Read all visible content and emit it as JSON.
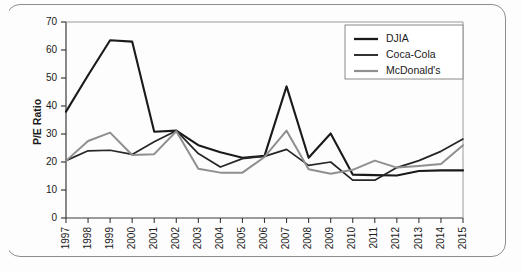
{
  "figure": {
    "frame_style": "rounded-rectangle-scan-border",
    "background_color": "#fdfdfd"
  },
  "chart_data": {
    "type": "line",
    "title": "",
    "subtitle": "",
    "xlabel": "",
    "ylabel": "P/E Ratio",
    "x": [
      1997,
      1998,
      1999,
      2000,
      2001,
      2002,
      2003,
      2004,
      2005,
      2006,
      2007,
      2008,
      2009,
      2010,
      2011,
      2012,
      2013,
      2014,
      2015
    ],
    "categories": [
      "1997",
      "1998",
      "1999",
      "2000",
      "2001",
      "2002",
      "2003",
      "2004",
      "2005",
      "2006",
      "2007",
      "2008",
      "2009",
      "2010",
      "2011",
      "2012",
      "2013",
      "2014",
      "2015"
    ],
    "xlim": [
      1997,
      2015
    ],
    "ylim": [
      0,
      70
    ],
    "yticks": [
      0,
      10,
      20,
      30,
      40,
      50,
      60,
      70
    ],
    "ytick_labels": [
      "0",
      "10",
      "20",
      "30",
      "40",
      "50",
      "60",
      "70"
    ],
    "grid": false,
    "legend_position": "top-right",
    "series": [
      {
        "name": "DJIA",
        "color": "#1a1a1a",
        "width": 2.1,
        "values": [
          38.0,
          51.0,
          63.5,
          63.0,
          30.8,
          31.2,
          26.0,
          23.5,
          21.5,
          22.2,
          47.0,
          21.5,
          30.2,
          15.5,
          15.3,
          15.2,
          16.8,
          17.0,
          17.0
        ]
      },
      {
        "name": "Coca-Cola",
        "color": "#262626",
        "width": 1.7,
        "values": [
          20.5,
          24.0,
          24.2,
          22.7,
          27.2,
          31.2,
          23.0,
          18.2,
          21.2,
          22.0,
          24.5,
          18.8,
          20.0,
          13.5,
          13.5,
          18.0,
          20.5,
          23.8,
          28.2
        ]
      },
      {
        "name": "McDonald's",
        "color": "#8f8f8f",
        "width": 2.0,
        "values": [
          20.4,
          27.5,
          30.5,
          22.5,
          22.8,
          31.0,
          17.6,
          16.2,
          16.2,
          21.8,
          31.2,
          17.4,
          15.8,
          17.2,
          20.5,
          18.0,
          18.6,
          19.3,
          26.0
        ]
      }
    ]
  },
  "legend": {
    "entries": [
      {
        "label": "DJIA"
      },
      {
        "label": "Coca-Cola"
      },
      {
        "label": "McDonald's"
      }
    ]
  }
}
